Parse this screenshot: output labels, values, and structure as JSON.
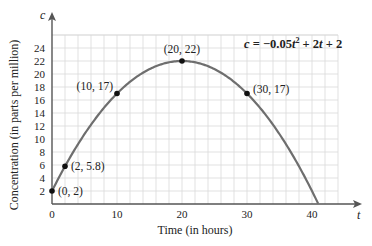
{
  "chart_data": {
    "type": "line",
    "title": "",
    "equation": "c = −0.05t² + 2t + 2",
    "equation_parts": {
      "lhs": "c",
      "eq": " = −0.05",
      "t1": "t",
      "sq": "2",
      "mid": " + 2",
      "t2": "t",
      "end": " + 2"
    },
    "xlabel": "Time (in hours)",
    "ylabel": "Concentration (in parts per million)",
    "x_var": "t",
    "y_var": "c",
    "xlim": [
      0,
      44
    ],
    "ylim": [
      0,
      26
    ],
    "grid": true,
    "x_ticks": [
      0,
      10,
      20,
      30,
      40
    ],
    "y_ticks": [
      2,
      4,
      6,
      8,
      10,
      12,
      14,
      16,
      18,
      20,
      22,
      24
    ],
    "curve": {
      "a": -0.05,
      "b": 2,
      "c": 2,
      "t_start": 0,
      "t_end": 40.95,
      "color": "#6e6e6e"
    },
    "points": [
      {
        "x": 0,
        "y": 2,
        "label": "(0, 2)"
      },
      {
        "x": 2,
        "y": 5.8,
        "label": "(2, 5.8)"
      },
      {
        "x": 10,
        "y": 17,
        "label": "(10, 17)"
      },
      {
        "x": 20,
        "y": 22,
        "label": "(20, 22)"
      },
      {
        "x": 30,
        "y": 17,
        "label": "(30, 17)"
      }
    ]
  },
  "colors": {
    "grid": "#d9d9d9",
    "axis": "#555555",
    "curve": "#6e6e6e",
    "point": "#111111"
  }
}
